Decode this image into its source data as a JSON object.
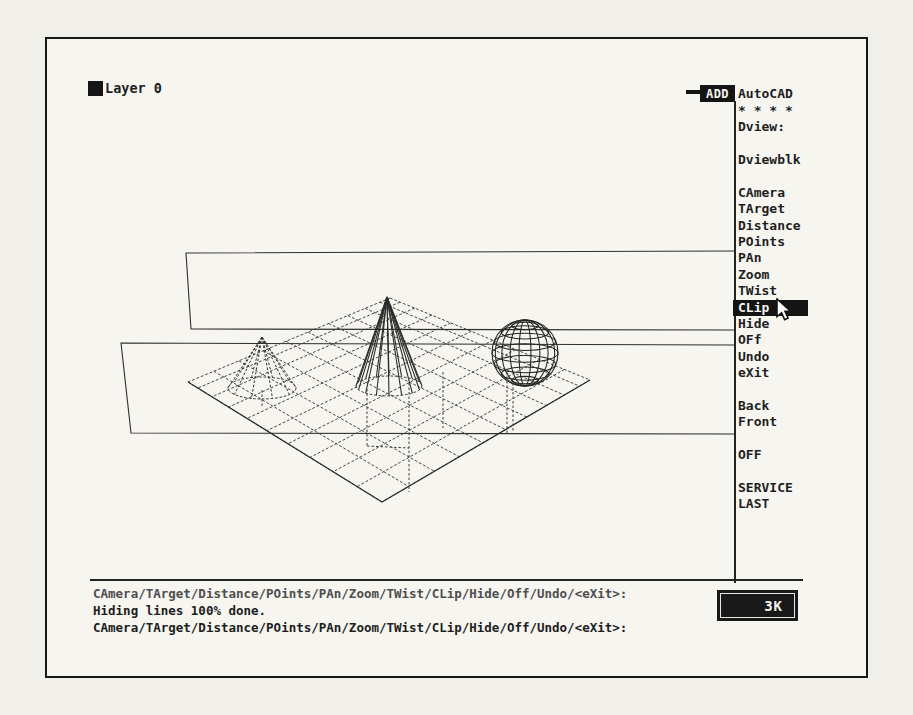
{
  "status": {
    "layer_label": "Layer 0"
  },
  "screen_menu": {
    "brand": "AutoCAD",
    "add_button": "ADD",
    "items": [
      {
        "label": "* * * *"
      },
      {
        "label": "Dview:"
      },
      {
        "label": ""
      },
      {
        "label": "Dviewblk"
      },
      {
        "label": ""
      },
      {
        "label": "CAmera"
      },
      {
        "label": "TArget"
      },
      {
        "label": "Distance"
      },
      {
        "label": "POints"
      },
      {
        "label": "PAn"
      },
      {
        "label": "Zoom"
      },
      {
        "label": "TWist"
      },
      {
        "label": "CLip",
        "highlighted": true
      },
      {
        "label": "Hide"
      },
      {
        "label": "OFf"
      },
      {
        "label": "Undo"
      },
      {
        "label": "eXit"
      },
      {
        "label": ""
      },
      {
        "label": "Back"
      },
      {
        "label": "Front"
      },
      {
        "label": ""
      },
      {
        "label": "OFF"
      },
      {
        "label": ""
      },
      {
        "label": "SERVICE"
      },
      {
        "label": "LAST"
      }
    ]
  },
  "command_area": {
    "lines": [
      {
        "text": "CAmera/TArget/Distance/POints/PAn/Zoom/TWist/CLip/Hide/Off/Undo/<eXit>:",
        "dim": true
      },
      {
        "text": "Hiding lines 100% done.",
        "dim": false
      },
      {
        "text": "CAmera/TArget/Distance/POints/PAn/Zoom/TWist/CLip/Hide/Off/Undo/<eXit>:",
        "dim": false
      }
    ],
    "memory_badge": "3K"
  },
  "scene": {
    "objects": [
      "ground-grid",
      "cone",
      "small-cone",
      "sphere",
      "clip-plane-upper",
      "clip-plane-lower",
      "drop-lines"
    ]
  },
  "colors": {
    "ink": "#1e1e1e",
    "paper": "#f1efe9",
    "screen_bg": "#f6f5f0",
    "highlight_bg": "#141414",
    "highlight_fg": "#f6f5f1"
  }
}
